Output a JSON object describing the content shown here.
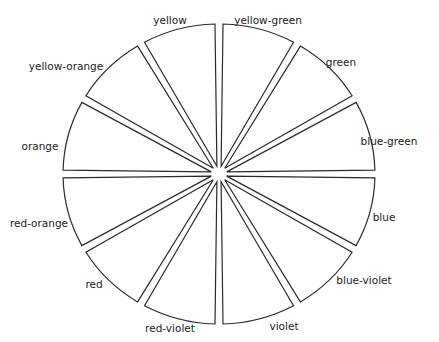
{
  "diagram": {
    "type": "color-wheel",
    "center": [
      219,
      174
    ],
    "radius_x": 156,
    "radius_y": 150,
    "segments": [
      {
        "name": "yellow-green",
        "start_deg": -90,
        "label_pos": [
          268,
          20
        ]
      },
      {
        "name": "green",
        "start_deg": -60,
        "label_pos": [
          340,
          62
        ]
      },
      {
        "name": "blue-green",
        "start_deg": -30,
        "label_pos": [
          389,
          141
        ]
      },
      {
        "name": "blue",
        "start_deg": 0,
        "label_pos": [
          384,
          220
        ]
      },
      {
        "name": "blue-violet",
        "start_deg": 30,
        "label_pos": [
          364,
          283
        ]
      },
      {
        "name": "violet",
        "start_deg": 60,
        "label_pos": [
          285,
          327
        ]
      },
      {
        "name": "red-violet",
        "start_deg": 90,
        "label_pos": [
          172,
          330
        ]
      },
      {
        "name": "red",
        "start_deg": 120,
        "label_pos": [
          92,
          286
        ]
      },
      {
        "name": "red-orange",
        "start_deg": 150,
        "label_pos": [
          34,
          225
        ]
      },
      {
        "name": "orange",
        "start_deg": 180,
        "label_pos": [
          42,
          147
        ]
      },
      {
        "name": "yellow-orange",
        "start_deg": 210,
        "label_pos": [
          67,
          66
        ]
      },
      {
        "name": "yellow",
        "start_deg": 240,
        "label_pos": [
          170,
          20
        ]
      }
    ]
  },
  "labels": {
    "yellow": "yellow",
    "yellow_green": "yellow-green",
    "green": "green",
    "blue_green": "blue-green",
    "blue": "blue",
    "blue_violet": "blue-violet",
    "violet": "violet",
    "red_violet": "red-violet",
    "red": "red",
    "red_orange": "red-orange",
    "orange": "orange",
    "yellow_orange": "yellow-orange"
  }
}
